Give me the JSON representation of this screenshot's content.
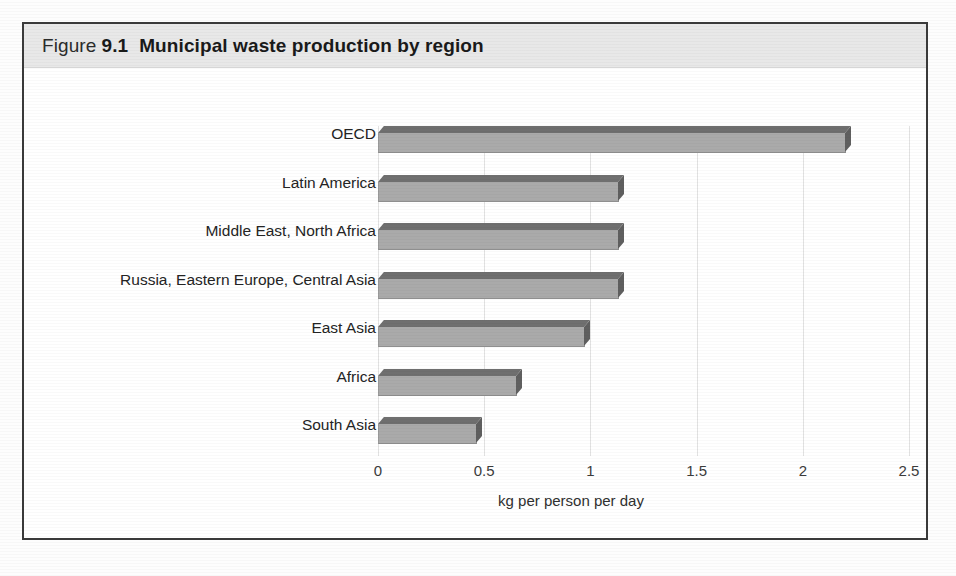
{
  "figure": {
    "label_word": "Figure",
    "number": "9.1",
    "title": "Municipal waste production by region"
  },
  "chart_data": {
    "type": "bar",
    "orientation": "horizontal",
    "title": "Municipal waste production by region",
    "xlabel": "kg per person per day",
    "ylabel": "",
    "xlim": [
      0,
      2.5
    ],
    "xticks": [
      "0",
      "0.5",
      "1",
      "1.5",
      "2",
      "2.5"
    ],
    "xtick_values": [
      0,
      0.5,
      1,
      1.5,
      2,
      2.5
    ],
    "grid": "vertical",
    "legend": "none",
    "categories": [
      "OECD",
      "Latin America",
      "Middle East, North Africa",
      "Russia, Eastern Europe, Central Asia",
      "East Asia",
      "Africa",
      "South Asia"
    ],
    "values": [
      2.2,
      1.13,
      1.13,
      1.13,
      0.97,
      0.65,
      0.46
    ],
    "bar_color": "#aaaaaa",
    "bar_top_color": "#6f6f6f",
    "bar_side_color": "#5f5f5f",
    "gridline_color": "#e2e2e2",
    "text_color": "#242424",
    "title_band_color": "#e8e8e8",
    "frame_color": "#3a3a3a"
  }
}
